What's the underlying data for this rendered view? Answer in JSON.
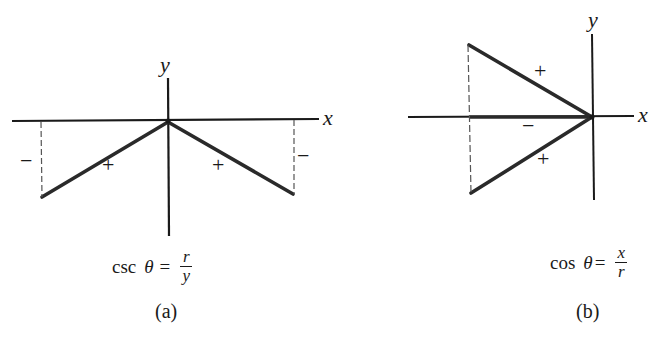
{
  "figures": [
    {
      "id": "a",
      "caption": "(a)",
      "axes": {
        "x_label": "x",
        "y_label": "y"
      },
      "formula": {
        "function": "csc",
        "variable": "θ",
        "equals": "=",
        "numerator": "r",
        "denominator": "y"
      },
      "segments": [
        {
          "name": "terminal-side-left",
          "sign": "+"
        },
        {
          "name": "terminal-side-right",
          "sign": "+"
        },
        {
          "name": "y-component-left",
          "sign": "−",
          "style": "dashed"
        },
        {
          "name": "y-component-right",
          "sign": "−",
          "style": "dashed"
        }
      ],
      "signs": {
        "left_y": "−",
        "left_r": "+",
        "right_r": "+",
        "right_y": "−"
      }
    },
    {
      "id": "b",
      "caption": "(b)",
      "axes": {
        "x_label": "x",
        "y_label": "y"
      },
      "formula": {
        "function": "cos",
        "variable": "θ",
        "equals": "=",
        "numerator": "x",
        "denominator": "r"
      },
      "segments": [
        {
          "name": "terminal-side-upper",
          "sign": "+"
        },
        {
          "name": "x-component",
          "sign": "−"
        },
        {
          "name": "terminal-side-lower",
          "sign": "+"
        },
        {
          "name": "vertical-dashed",
          "style": "dashed"
        }
      ],
      "signs": {
        "upper_r": "+",
        "x": "−",
        "lower_r": "+"
      }
    }
  ],
  "colors": {
    "line": "#1a1a1a",
    "dashed": "#555555",
    "background": "#ffffff"
  }
}
